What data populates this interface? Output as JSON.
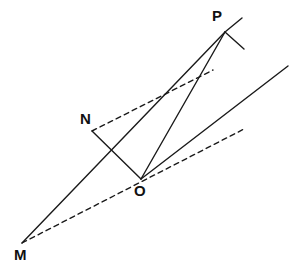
{
  "figure": {
    "name": "geometry-diagram",
    "background": "#ffffff",
    "stroke_color": "#1a1a1a",
    "width": 300,
    "height": 277,
    "labels": [
      {
        "text": "M",
        "x": 14,
        "y": 247,
        "point": "M"
      },
      {
        "text": "N",
        "x": 80,
        "y": 111,
        "point": "N"
      },
      {
        "text": "O",
        "x": 134,
        "y": 183,
        "point": "O"
      },
      {
        "text": "P",
        "x": 212,
        "y": 8,
        "point": "P"
      }
    ],
    "vertices": {
      "M": {
        "x": 22,
        "y": 243
      },
      "N": {
        "x": 92,
        "y": 131
      },
      "O": {
        "x": 141,
        "y": 179
      },
      "P": {
        "x": 225,
        "y": 32
      }
    },
    "solid_segments": [
      {
        "name": "segment-M-P",
        "x1": 22,
        "y1": 243,
        "x2": 225,
        "y2": 32
      },
      {
        "name": "segment-N-O",
        "x1": 92,
        "y1": 131,
        "x2": 141,
        "y2": 179
      },
      {
        "name": "segment-O-P",
        "x1": 141,
        "y1": 179,
        "x2": 225,
        "y2": 32
      },
      {
        "name": "ray-from-O-upper-right",
        "x1": 141,
        "y1": 179,
        "x2": 288,
        "y2": 66
      },
      {
        "name": "tick-at-P-upper",
        "x1": 225,
        "y1": 32,
        "x2": 242,
        "y2": 18
      },
      {
        "name": "tick-at-P-lower",
        "x1": 225,
        "y1": 32,
        "x2": 244,
        "y2": 49
      }
    ],
    "dashed_segments": [
      {
        "name": "dashed-M-through-O",
        "x1": 22,
        "y1": 243,
        "x2": 246,
        "y2": 128
      },
      {
        "name": "dashed-from-N",
        "x1": 92,
        "y1": 131,
        "x2": 213,
        "y2": 70
      }
    ],
    "dash_pattern": "5 4",
    "stroke_width": 1.4
  }
}
